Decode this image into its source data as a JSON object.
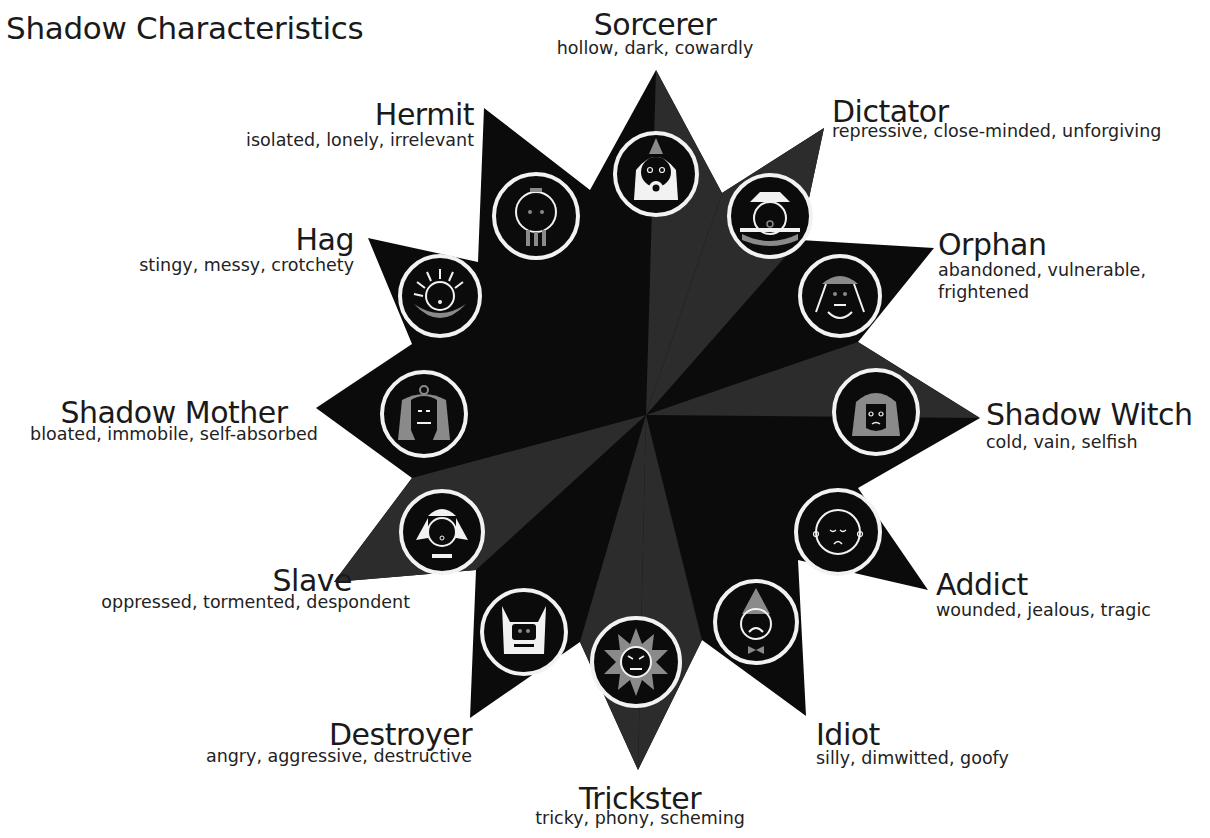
{
  "title": "Shadow Characteristics",
  "colors": {
    "star_dark": "#0b0b0b",
    "star_facet": "#2a2a2a",
    "icon_ring": "#f2f2f2",
    "icon_gray": "#8a8a8a",
    "text": "#1a1a1a"
  },
  "archetypes": [
    {
      "name": "Sorcerer",
      "traits": "hollow, dark, cowardly",
      "icon": "sorcerer-face-icon"
    },
    {
      "name": "Dictator",
      "traits": "repressive, close-minded, unforgiving",
      "icon": "dictator-face-icon"
    },
    {
      "name": "Orphan",
      "traits": "abandoned, vulnerable,",
      "traits2": "frightened",
      "icon": "orphan-face-icon"
    },
    {
      "name": "Shadow Witch",
      "traits": "cold, vain, selfish",
      "icon": "shadow-witch-face-icon"
    },
    {
      "name": "Addict",
      "traits": "wounded, jealous, tragic",
      "icon": "addict-face-icon"
    },
    {
      "name": "Idiot",
      "traits": "silly, dimwitted, goofy",
      "icon": "idiot-face-icon"
    },
    {
      "name": "Trickster",
      "traits": "tricky, phony, scheming",
      "icon": "trickster-face-icon"
    },
    {
      "name": "Destroyer",
      "traits": "angry, aggressive, destructive",
      "icon": "destroyer-face-icon"
    },
    {
      "name": "Slave",
      "traits": "oppressed, tormented, despondent",
      "icon": "slave-face-icon"
    },
    {
      "name": "Shadow Mother",
      "traits": "bloated, immobile, self-absorbed",
      "icon": "shadow-mother-face-icon"
    },
    {
      "name": "Hag",
      "traits": "stingy, messy, crotchety",
      "icon": "hag-face-icon"
    },
    {
      "name": "Hermit",
      "traits": "isolated, lonely, irrelevant",
      "icon": "hermit-face-icon"
    }
  ]
}
